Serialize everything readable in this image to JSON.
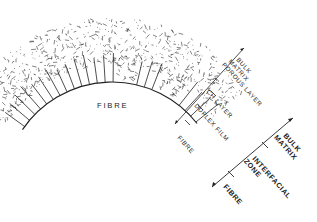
{
  "diagram": {
    "fibre_label": "FIBRE",
    "inner_scale": {
      "labels": [
        "BULK",
        "MATRIX",
        "POROUS LAYER",
        "CH LAYER",
        "DUPLEX FILM",
        "FIBRE"
      ]
    },
    "outer_scale": {
      "labels": [
        "BULK",
        "MATRIX",
        "INTERFACIAL",
        "ZONE",
        "FIBRE"
      ]
    },
    "colors": {
      "ink": "#222222",
      "background": "#ffffff"
    }
  }
}
